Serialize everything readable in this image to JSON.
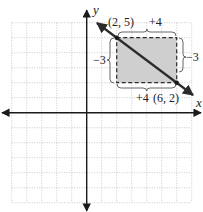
{
  "graph": {
    "x_axis_label": "x",
    "y_axis_label": "y",
    "grid": {
      "x_min": -5,
      "x_max": 7,
      "y_min": -6,
      "y_max": 6,
      "unit_px": 15,
      "origin_px": [
        86.7,
        112.7
      ]
    },
    "line": {
      "point_a": {
        "x": 2,
        "y": 5,
        "label": "(2, 5)"
      },
      "point_b": {
        "x": 6,
        "y": 2,
        "label": "(6, 2)"
      }
    },
    "slope_triangle": {
      "top_run_label": "+4",
      "bottom_run_label": "+4",
      "left_rise_label": "−3",
      "right_rise_label": "−3"
    }
  },
  "colors": {
    "grid": "#bdbdbd",
    "axis": "#1a1a1a",
    "line": "#2b2b2b",
    "shade": "#cfcfcf",
    "dash": "#2b2b2b",
    "brace": "#555555"
  }
}
